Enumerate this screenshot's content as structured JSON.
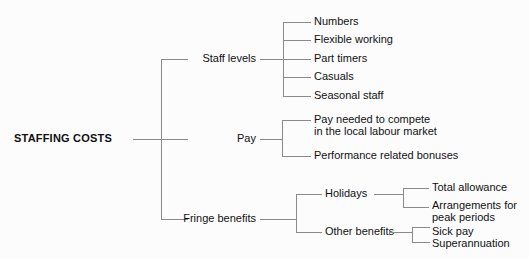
{
  "diagram": {
    "type": "mind-map-tree",
    "title": "STAFFING COSTS",
    "orientation": "left-to-right",
    "line_color": "#8a8a8a",
    "text_color": "#111111",
    "background_color": "#fcfcfc",
    "root": {
      "label": "STAFFING COSTS",
      "bold": true
    },
    "branches": [
      {
        "label": "Staff levels",
        "children": [
          {
            "label": "Numbers"
          },
          {
            "label": "Flexible working"
          },
          {
            "label": "Part timers"
          },
          {
            "label": "Casuals"
          },
          {
            "label": "Seasonal staff"
          }
        ]
      },
      {
        "label": "Pay",
        "children": [
          {
            "label": "Pay needed to compete\nin the local labour market"
          },
          {
            "label": "Performance related bonuses"
          }
        ]
      },
      {
        "label": "Fringe benefits",
        "children": [
          {
            "label": "Holidays",
            "children": [
              {
                "label": "Total allowance"
              },
              {
                "label": "Arrangements for\npeak periods"
              }
            ]
          },
          {
            "label": "Other benefits",
            "children": [
              {
                "label": "Sick pay\nSuperannuation"
              }
            ]
          }
        ]
      }
    ]
  }
}
